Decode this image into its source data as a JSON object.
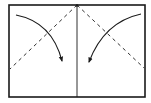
{
  "diagram": {
    "type": "origami-fold-step",
    "stroke_color": "#1a1a1a",
    "background": "#ffffff",
    "paper": {
      "x": 9,
      "y": 5,
      "width": 136,
      "height": 92
    },
    "center_crease": {
      "x": 77,
      "y1": 5,
      "y2": 97
    },
    "valley_folds": [
      {
        "name": "left-fold-line",
        "x1": 77,
        "y1": 5,
        "x2": 10,
        "y2": 69
      },
      {
        "name": "right-fold-line",
        "x1": 77,
        "y1": 5,
        "x2": 144,
        "y2": 68
      }
    ],
    "arrows": [
      {
        "name": "left-fold-arrow",
        "path": "M16 15 Q52 22 62 61"
      },
      {
        "name": "right-fold-arrow",
        "path": "M141 14 Q104 22 89 62"
      }
    ]
  }
}
